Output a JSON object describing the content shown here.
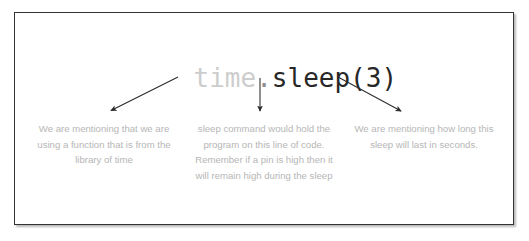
{
  "card": {
    "border_color": "#333333",
    "background_color": "#ffffff"
  },
  "code_title": {
    "module": "time",
    "dot": ".",
    "call": "sleep(3)",
    "full_text": "time.sleep(3)",
    "module_color": "#cdcdcd",
    "call_color": "#272727"
  },
  "arrows": [
    {
      "name": "arrow-to-library-note",
      "direction": "down-left",
      "from": {
        "x": 163,
        "y": 64
      },
      "to": {
        "x": 94,
        "y": 99
      }
    },
    {
      "name": "arrow-to-sleep-note",
      "direction": "down",
      "from": {
        "x": 245,
        "y": 65
      },
      "to": {
        "x": 245,
        "y": 100
      }
    },
    {
      "name": "arrow-to-duration-note",
      "direction": "down-right",
      "from": {
        "x": 323,
        "y": 64
      },
      "to": {
        "x": 388,
        "y": 100
      }
    }
  ],
  "captions": {
    "text_color": "#b6b6b6",
    "items": [
      {
        "name": "caption-library",
        "text": "We are mentioning that we are using a function that is from the library of time"
      },
      {
        "name": "caption-sleep-behavior",
        "text": "sleep command would hold the program on this line of code. Remember if a pin is high then it will remain high during the sleep"
      },
      {
        "name": "caption-duration",
        "text": "We are mentioning how long this sleep will last in seconds."
      }
    ]
  }
}
